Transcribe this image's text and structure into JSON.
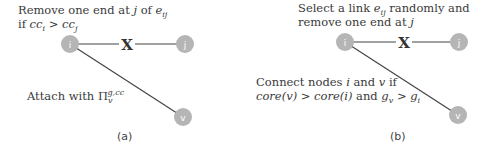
{
  "colors": {
    "node_fill": "#b5b5b5",
    "edge": "#444444",
    "text": "#3a3a3a"
  },
  "panels": [
    {
      "id": "a",
      "caption": "(a)",
      "top_text": {
        "line1_prefix": "Remove one end at ",
        "line1_var_j": "j",
        "line1_mid": " of ",
        "line1_var_e": "e",
        "line1_sub_ij": "ij",
        "line2_prefix": "if ",
        "line2_cc_i": "cc",
        "line2_sub_i": "i",
        "line2_op": " > ",
        "line2_cc_j": "cc",
        "line2_sub_j": "j"
      },
      "bottom_text": {
        "prefix": "Attach with ",
        "symbol": "Π",
        "sub": "v",
        "sup": "g,cc"
      },
      "nodes": [
        {
          "label": "i",
          "x": 70,
          "y": 44
        },
        {
          "label": "j",
          "x": 185,
          "y": 44
        },
        {
          "label": "v",
          "x": 183,
          "y": 117
        }
      ],
      "removed_edge_mark": "X"
    },
    {
      "id": "b",
      "caption": "(b)",
      "top_text": {
        "line1_prefix": "Select a link ",
        "line1_var_e": "e",
        "line1_sub_ij": "ij",
        "line1_suffix": " randomly and",
        "line2_prefix": "remove one end at ",
        "line2_var_j": "j"
      },
      "bottom_text": {
        "line1_prefix": "Connect nodes ",
        "line1_var_i": "i",
        "line1_mid": " and ",
        "line1_var_v": "v",
        "line1_suffix": " if",
        "line2_core_v": "core(v)",
        "line2_op1": " > ",
        "line2_core_i": "core(i)",
        "line2_and": " and ",
        "line2_g": "g",
        "line2_sub_v": "v",
        "line2_op2": " > ",
        "line2_g2": "g",
        "line2_sub_i": "i"
      },
      "nodes": [
        {
          "label": "i",
          "x": 345,
          "y": 42
        },
        {
          "label": "j",
          "x": 459,
          "y": 42
        },
        {
          "label": "v",
          "x": 458,
          "y": 115
        }
      ],
      "removed_edge_mark": "X"
    }
  ]
}
